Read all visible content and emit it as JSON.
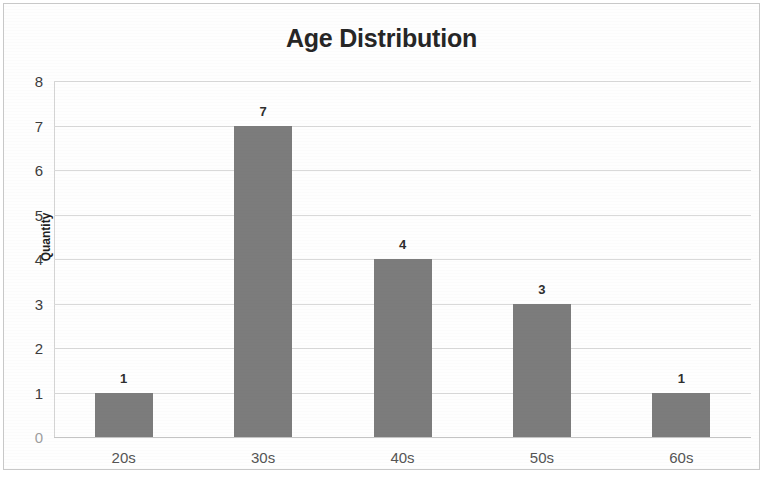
{
  "chart_data": {
    "type": "bar",
    "title": "Age Distribution",
    "xlabel": "",
    "ylabel": "Quantity",
    "categories": [
      "20s",
      "30s",
      "40s",
      "50s",
      "60s"
    ],
    "values": [
      1,
      7,
      4,
      3,
      1
    ],
    "data_labels": [
      "1",
      "7",
      "4",
      "3",
      "1"
    ],
    "ylim": [
      0,
      8
    ],
    "ytick_labels": [
      "0",
      "1",
      "2",
      "3",
      "4",
      "5",
      "6",
      "7",
      "8"
    ],
    "ytick_values": [
      0,
      1,
      2,
      3,
      4,
      5,
      6,
      7,
      8
    ],
    "grid": true,
    "legend": false,
    "legend_position": "none",
    "series_color": "#7c7c7c",
    "gridline_color": "#d9d9d9",
    "title_color": "#262626"
  },
  "frame": {
    "border_color": "#c8c8c8",
    "background": "#fefefe"
  }
}
